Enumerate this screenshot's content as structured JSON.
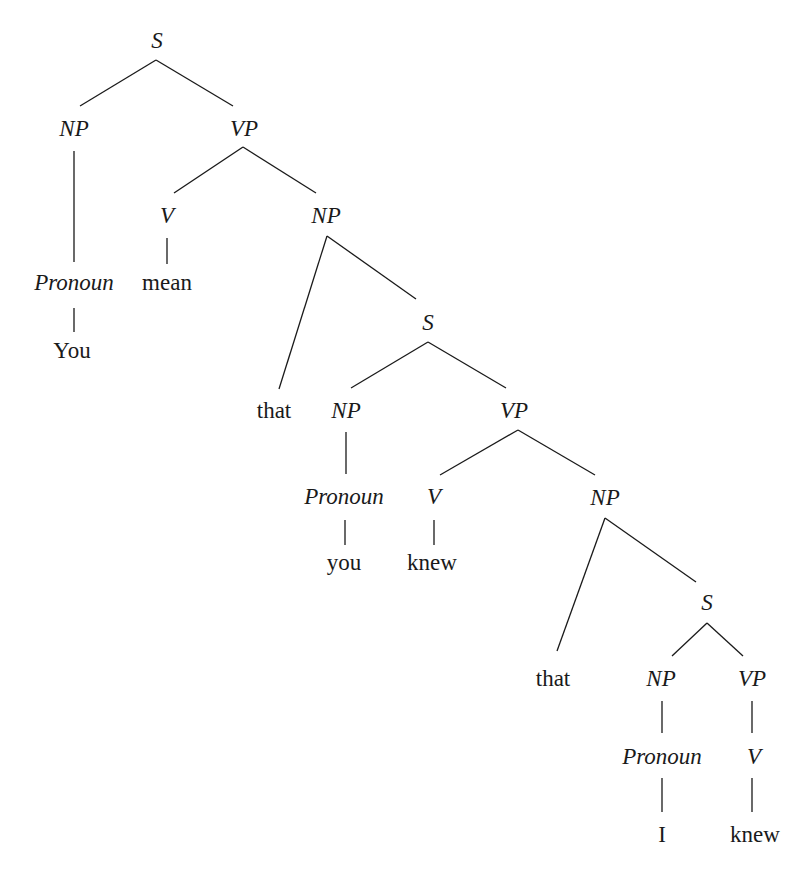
{
  "diagram": {
    "type": "syntax-tree",
    "sentence": "You mean that you knew that I knew",
    "nodes": [
      {
        "id": "s1",
        "label": "S",
        "kind": "category",
        "x": 157,
        "y": 40
      },
      {
        "id": "np1",
        "label": "NP",
        "kind": "category",
        "x": 74,
        "y": 128
      },
      {
        "id": "vp1",
        "label": "VP",
        "kind": "category",
        "x": 244,
        "y": 128
      },
      {
        "id": "pron1",
        "label": "Pronoun",
        "kind": "category",
        "x": 74,
        "y": 282
      },
      {
        "id": "w_you1",
        "label": "You",
        "kind": "word",
        "x": 72,
        "y": 350
      },
      {
        "id": "v1",
        "label": "V",
        "kind": "category",
        "x": 167,
        "y": 215
      },
      {
        "id": "w_mean",
        "label": "mean",
        "kind": "word",
        "x": 167,
        "y": 282
      },
      {
        "id": "np2",
        "label": "NP",
        "kind": "category",
        "x": 326,
        "y": 215
      },
      {
        "id": "w_that1",
        "label": "that",
        "kind": "word",
        "x": 274,
        "y": 410
      },
      {
        "id": "s2",
        "label": "S",
        "kind": "category",
        "x": 428,
        "y": 322
      },
      {
        "id": "np3",
        "label": "NP",
        "kind": "category",
        "x": 346,
        "y": 410
      },
      {
        "id": "pron2",
        "label": "Pronoun",
        "kind": "category",
        "x": 344,
        "y": 496
      },
      {
        "id": "w_you2",
        "label": "you",
        "kind": "word",
        "x": 344,
        "y": 562
      },
      {
        "id": "vp2",
        "label": "VP",
        "kind": "category",
        "x": 514,
        "y": 410
      },
      {
        "id": "v2",
        "label": "V",
        "kind": "category",
        "x": 434,
        "y": 496
      },
      {
        "id": "w_knew1",
        "label": "knew",
        "kind": "word",
        "x": 432,
        "y": 562
      },
      {
        "id": "np4",
        "label": "NP",
        "kind": "category",
        "x": 605,
        "y": 497
      },
      {
        "id": "w_that2",
        "label": "that",
        "kind": "word",
        "x": 553,
        "y": 678
      },
      {
        "id": "s3",
        "label": "S",
        "kind": "category",
        "x": 707,
        "y": 602
      },
      {
        "id": "np5",
        "label": "NP",
        "kind": "category",
        "x": 661,
        "y": 678
      },
      {
        "id": "pron3",
        "label": "Pronoun",
        "kind": "category",
        "x": 662,
        "y": 756
      },
      {
        "id": "w_i",
        "label": "I",
        "kind": "word",
        "x": 662,
        "y": 834
      },
      {
        "id": "vp3",
        "label": "VP",
        "kind": "category",
        "x": 752,
        "y": 678
      },
      {
        "id": "v3",
        "label": "V",
        "kind": "category",
        "x": 754,
        "y": 756
      },
      {
        "id": "w_knew2",
        "label": "knew",
        "kind": "word",
        "x": 755,
        "y": 834
      }
    ],
    "edges": [
      {
        "from": "s1",
        "to": "np1",
        "x1": 156,
        "y1": 60,
        "x2": 80,
        "y2": 106
      },
      {
        "from": "s1",
        "to": "vp1",
        "x1": 156,
        "y1": 60,
        "x2": 233,
        "y2": 106
      },
      {
        "from": "np1",
        "to": "pron1",
        "x1": 74,
        "y1": 151,
        "x2": 74,
        "y2": 262
      },
      {
        "from": "pron1",
        "to": "w_you1",
        "x1": 74,
        "y1": 308,
        "x2": 74,
        "y2": 332
      },
      {
        "from": "vp1",
        "to": "v1",
        "x1": 243,
        "y1": 147,
        "x2": 174,
        "y2": 193
      },
      {
        "from": "vp1",
        "to": "np2",
        "x1": 243,
        "y1": 147,
        "x2": 316,
        "y2": 193
      },
      {
        "from": "v1",
        "to": "w_mean",
        "x1": 167,
        "y1": 238,
        "x2": 167,
        "y2": 264
      },
      {
        "from": "np2",
        "to": "w_that1",
        "x1": 327,
        "y1": 236,
        "x2": 279,
        "y2": 389
      },
      {
        "from": "np2",
        "to": "s2",
        "x1": 327,
        "y1": 236,
        "x2": 416,
        "y2": 299
      },
      {
        "from": "s2",
        "to": "np3",
        "x1": 428,
        "y1": 342,
        "x2": 351,
        "y2": 388
      },
      {
        "from": "s2",
        "to": "vp2",
        "x1": 428,
        "y1": 342,
        "x2": 506,
        "y2": 388
      },
      {
        "from": "np3",
        "to": "pron2",
        "x1": 346,
        "y1": 432,
        "x2": 346,
        "y2": 474
      },
      {
        "from": "pron2",
        "to": "w_you2",
        "x1": 345,
        "y1": 520,
        "x2": 345,
        "y2": 545
      },
      {
        "from": "vp2",
        "to": "v2",
        "x1": 518,
        "y1": 430,
        "x2": 440,
        "y2": 475
      },
      {
        "from": "vp2",
        "to": "np4",
        "x1": 518,
        "y1": 430,
        "x2": 595,
        "y2": 475
      },
      {
        "from": "v2",
        "to": "w_knew1",
        "x1": 434,
        "y1": 520,
        "x2": 434,
        "y2": 545
      },
      {
        "from": "np4",
        "to": "w_that2",
        "x1": 605,
        "y1": 518,
        "x2": 557,
        "y2": 651
      },
      {
        "from": "np4",
        "to": "s3",
        "x1": 605,
        "y1": 518,
        "x2": 696,
        "y2": 582
      },
      {
        "from": "s3",
        "to": "np5",
        "x1": 707,
        "y1": 623,
        "x2": 672,
        "y2": 656
      },
      {
        "from": "s3",
        "to": "vp3",
        "x1": 707,
        "y1": 623,
        "x2": 743,
        "y2": 656
      },
      {
        "from": "np5",
        "to": "pron3",
        "x1": 662,
        "y1": 701,
        "x2": 662,
        "y2": 733
      },
      {
        "from": "vp3",
        "to": "v3",
        "x1": 752,
        "y1": 701,
        "x2": 752,
        "y2": 733
      },
      {
        "from": "pron3",
        "to": "w_i",
        "x1": 662,
        "y1": 778,
        "x2": 662,
        "y2": 812
      },
      {
        "from": "v3",
        "to": "w_knew2",
        "x1": 752,
        "y1": 778,
        "x2": 752,
        "y2": 812
      }
    ]
  }
}
